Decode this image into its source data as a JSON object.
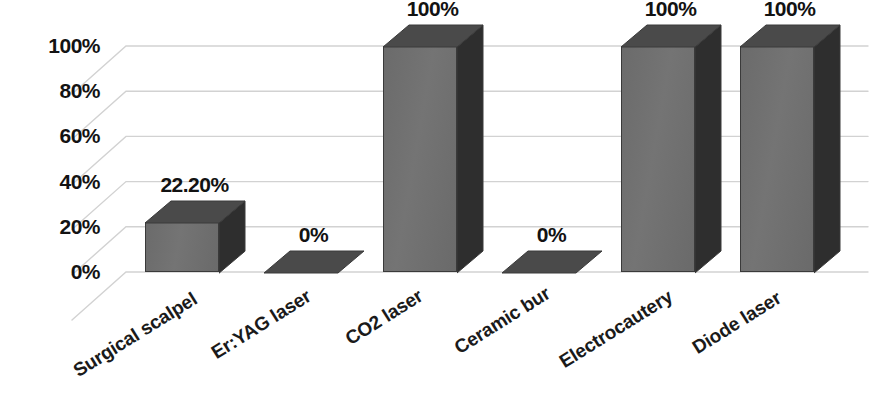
{
  "chart_data": {
    "type": "bar",
    "title": "",
    "subtitle": "",
    "xlabel": "",
    "ylabel": "",
    "categories": [
      "Surgical scalpel",
      "Er:YAG laser",
      "CO2 laser",
      "Ceramic bur",
      "Electrocautery",
      "Diode laser"
    ],
    "values": [
      22.2,
      0,
      100,
      0,
      100,
      100
    ],
    "data_labels": [
      "22.20%",
      "0%",
      "100%",
      "0%",
      "100%",
      "100%"
    ],
    "ylim": [
      0,
      100
    ],
    "ytick_values": [
      0,
      20,
      40,
      60,
      80,
      100
    ],
    "ytick_labels": [
      "0%",
      "20%",
      "40%",
      "60%",
      "80%",
      "100%"
    ],
    "grid": true,
    "legend": false,
    "legend_position": "none",
    "style": "3d-column",
    "series": [
      {
        "name": "",
        "values": [
          22.2,
          0,
          100,
          0,
          100,
          100
        ]
      }
    ]
  },
  "colors": {
    "bar_front": "#6e6e6e",
    "bar_top": "#4a4a4a",
    "bar_side": "#2e2e2e",
    "bar_outline": "#3a3a3a",
    "gridline": "#d2d2d2",
    "text": "#121212",
    "background": "#ffffff"
  },
  "cropped_caption": ""
}
